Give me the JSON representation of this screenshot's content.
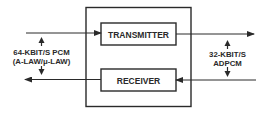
{
  "diagram": {
    "colors": {
      "stroke": "#2a2a2a",
      "background": "#ffffff"
    },
    "blocks": {
      "transmitter": {
        "label": "TRANSMITTER"
      },
      "receiver": {
        "label": "RECEIVER"
      }
    },
    "left_interface": {
      "line1": "64-KBIT/S PCM",
      "line2": "(A-LAW/μ-LAW)"
    },
    "right_interface": {
      "line1": "32-KBIT/S",
      "line2": "ADPCM"
    }
  }
}
